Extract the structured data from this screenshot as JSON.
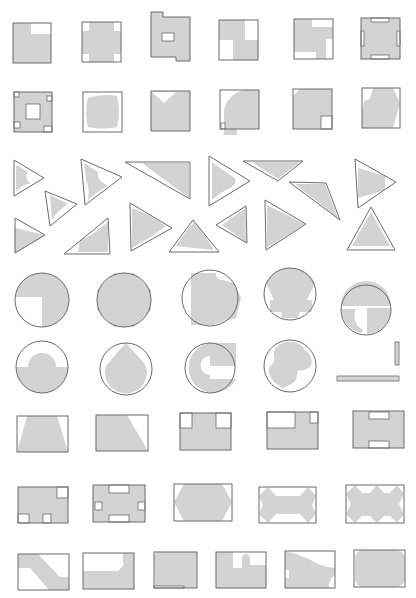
{
  "figure": {
    "title": "",
    "colors": {
      "fill": "#d3d3d3",
      "outline": "#6a6a6a",
      "background": "#ffffff"
    },
    "rows": [
      {
        "name": "squares-row-1",
        "count": 6
      },
      {
        "name": "squares-row-2",
        "count": 6
      },
      {
        "name": "triangles",
        "count": 15
      },
      {
        "name": "circles-row-1",
        "count": 5
      },
      {
        "name": "circles-row-2",
        "count": 5
      },
      {
        "name": "rectangles-row-1",
        "count": 5
      },
      {
        "name": "rectangles-row-2",
        "count": 5
      },
      {
        "name": "rectangles-row-3",
        "count": 6
      }
    ]
  },
  "shapes": [
    {
      "id": "sq1",
      "type": "rect-notched",
      "outline": [
        13,
        23,
        38,
        40
      ],
      "fill": "M13,23H31V34H51V63H13Z",
      "holes": []
    },
    {
      "id": "sq2",
      "type": "rect-corners",
      "outline": [
        82,
        22,
        39,
        40
      ],
      "fill": "M89,22H114V31H121V54H114V62H89V54H82V31H89Z",
      "holes": []
    },
    {
      "id": "sq3",
      "type": "rect-with-hole",
      "outline": null,
      "fill": "M151,12H163V17H190V61H176V57H151Z",
      "holes": [
        [
          162,
          33,
          12,
          8
        ]
      ]
    },
    {
      "id": "sq4",
      "type": "rect-pinwheel",
      "outline": [
        219,
        20,
        39,
        40
      ],
      "fill": "M219,20H245V40H258V60H233V40H219Z",
      "holes": []
    },
    {
      "id": "sq5",
      "type": "rect-pinwheel",
      "outline": [
        294,
        19,
        39,
        40
      ],
      "fill": "M302,19H312V27H333V39H326V59H316V52H294V19Z",
      "holes": []
    },
    {
      "id": "sq6",
      "type": "rect-slots",
      "outline": [
        361,
        18,
        39,
        41
      ],
      "fill": "M361,18H400V59H361Z",
      "holes": [
        [
          371,
          18,
          18,
          4
        ],
        [
          371,
          55,
          18,
          4
        ],
        [
          361,
          31,
          3,
          15
        ],
        [
          397,
          31,
          3,
          15
        ]
      ]
    },
    {
      "id": "sq7",
      "type": "rect-hollow",
      "outline": [
        14,
        92,
        38,
        40
      ],
      "fill": "M14,92H52V132H14Z",
      "holes": [
        [
          26,
          104,
          14,
          15
        ],
        [
          14,
          92,
          5,
          5
        ],
        [
          47,
          96,
          5,
          5
        ],
        [
          14,
          122,
          6,
          6
        ],
        [
          44,
          126,
          8,
          6
        ]
      ]
    },
    {
      "id": "sq8",
      "type": "rect-rounded-blob",
      "outline": [
        83,
        92,
        39,
        40
      ],
      "fill": "M88,98Q102,93 117,96Q121,112 117,127Q102,130 88,127Q84,112 88,98Z",
      "holes": []
    },
    {
      "id": "sq9",
      "type": "rect-v-notch",
      "outline": null,
      "fill": "M151,91H190V131H151Z",
      "holes": [],
      "cuts": "M152,92L176,92L164,103Z"
    },
    {
      "id": "sq10",
      "type": "rect-quarter-circle",
      "outline": [
        220,
        90,
        39,
        39
      ],
      "fill": "M244,90H259V129H237V135H224V110Q228,94 244,90Z",
      "holes": [
        [
          221,
          123,
          4,
          6
        ]
      ]
    },
    {
      "id": "sq11",
      "type": "rect-corner-cut",
      "outline": [
        293,
        89,
        39,
        40
      ],
      "fill": "M300,89H332V129H293V96Z",
      "holes": [
        [
          321,
          116,
          11,
          13
        ]
      ]
    },
    {
      "id": "sq12",
      "type": "rect-hexagon",
      "outline": [
        362,
        88,
        38,
        40
      ],
      "fill": "M373,88H393L400,103L393,128H362V110L368,88Z",
      "holes": [],
      "cuts": "M362,88L373,88L370,99L363,101Z"
    }
  ],
  "triangles": [
    {
      "id": "tri1",
      "points": "14,160 44,178 14,196",
      "blobs": "M16,165Q22,168 28,172Q24,178 30,184Q22,184 16,192Z"
    },
    {
      "id": "tri2",
      "points": "81,159 122,177 85,205",
      "blobs": "M84,163Q92,168 98,172Q96,180 108,186Q96,192 88,200Q90,188 86,180Z"
    },
    {
      "id": "tri3",
      "points": "125,162 190,162 190,199",
      "blobs": "M142,163L189,163L189,198Z"
    },
    {
      "id": "tri4",
      "points": "209,156 250,181 209,206",
      "blobs": "M212,162Q222,170 232,176Q240,182 230,188Q218,194 212,200Z"
    },
    {
      "id": "tri5",
      "points": "243,161 303,161 278,181",
      "blobs": "M252,162L300,162L278,179Z"
    },
    {
      "id": "tri6",
      "points": "355,159 396,182 358,208",
      "blobs": "M358,168L385,176L385,190L358,198Z"
    },
    {
      "id": "tri7",
      "points": "45,191 77,204 50,226",
      "blobs": "M50,195Q60,200 68,204Q58,210 52,220Z"
    },
    {
      "id": "tri8",
      "points": "289,182 326,183 340,220",
      "blobs": "M295,184L325,184L338,218Z"
    },
    {
      "id": "tri9",
      "points": "15,218 45,235 15,253",
      "blobs": "M15,228L45,235L15,253Z"
    },
    {
      "id": "tri10",
      "points": "64,254 108,218 110,254",
      "blobs": "M80,240Q92,236 100,228L108,222L108,252L78,252Z"
    },
    {
      "id": "tri11",
      "points": "130,203 172,228 131,251",
      "blobs": "M132,208Q150,214 166,226Q150,238 132,248Z"
    },
    {
      "id": "tri12",
      "points": "169,252 193,220 219,252",
      "blobs": "M176,246Q186,230 194,222Q206,236 214,250Z"
    },
    {
      "id": "tri13",
      "points": "216,225 246,206 247,243",
      "blobs": "M222,225L245,208L246,242Z"
    },
    {
      "id": "tri14",
      "points": "265,200 306,224 266,250",
      "blobs": "M267,205L305,224L267,248Z"
    },
    {
      "id": "tri15",
      "points": "347,250 371,207 395,250",
      "blobs": "M352,246L371,212L390,246Z"
    }
  ],
  "circles": [
    {
      "id": "c1",
      "cx": 42,
      "cy": 300,
      "r": 27,
      "fill": "M42,273A27,27 0 1 1 42,327L42,297L15,297A27,27 0 0 1 42,273Z"
    },
    {
      "id": "c2",
      "cx": 124,
      "cy": 300,
      "r": 27,
      "fill": "M114,273L134,273L151,290L151,310L134,327L114,327L97,310L97,290Z"
    },
    {
      "id": "c3",
      "cx": 210,
      "cy": 298,
      "r": 28,
      "fill": "M191,273H215L218,279L234,283L241,298L236,318L213,325L191,325Z"
    },
    {
      "id": "c4",
      "cx": 290,
      "cy": 294,
      "r": 26,
      "fill": "M290,268A26,26 0 0 1 315,283L307,300H312V312H300L298,318H282L281,312H270V300H274L266,283A26,26 0 0 1 290,268Z"
    },
    {
      "id": "c5",
      "cx": 366,
      "cy": 310,
      "r": 25,
      "fill": "M341,306A25,25 0 0 1 391,306Z M367,308H391A25,25 0 0 1 367,334Z M346,309H356A16,16 0 0 0 363,330L362,333A25,25 0 0 1 341,309Z"
    },
    {
      "id": "c6",
      "cx": 42,
      "cy": 367,
      "r": 26,
      "fill": "M28,367A14,14 0 0 1 56,367H68A26,26 0 0 1 16,367Z"
    },
    {
      "id": "c7",
      "cx": 126,
      "cy": 369,
      "r": 26,
      "fill": "M126,343Q138,356 146,366A21,21 0 1 1 106,366Q114,356 126,343Z"
    },
    {
      "id": "c8",
      "cx": 210,
      "cy": 368,
      "r": 25,
      "fill": "M210,343H236V366H210V379H236A25,25 0 1 1 210,343Z M210,356A8,8 0 0 0 210,375Z"
    },
    {
      "id": "c9",
      "cx": 290,
      "cy": 366,
      "r": 26,
      "fill": "M284,342Q300,340 305,350Q314,356 311,366Q304,372 298,370L296,380Q290,386 282,388L274,382Q266,372 270,366Q276,362 274,356Q272,348 284,342Z"
    }
  ],
  "bars": [
    {
      "id": "bar-vertical",
      "x": 395,
      "y": 342,
      "w": 4,
      "h": 23
    },
    {
      "id": "bar-horizontal",
      "x": 337,
      "y": 376,
      "w": 62,
      "h": 5
    }
  ],
  "rects": [
    {
      "id": "r1",
      "outline": [
        17,
        416,
        51,
        36
      ],
      "fill": "M27,416H57L68,452H17Z"
    },
    {
      "id": "r2",
      "outline": [
        96,
        415,
        52,
        36
      ],
      "fill": "M96,415H127L148,451H96Z"
    },
    {
      "id": "r3",
      "outline": [
        180,
        413,
        51,
        37
      ],
      "fill": "M180,413H231V450H180Z",
      "holes": [
        [
          180,
          413,
          12,
          15
        ],
        [
          216,
          413,
          15,
          15
        ]
      ]
    },
    {
      "id": "r4",
      "outline": [
        267,
        412,
        51,
        37
      ],
      "fill": "M267,412H318V449H267Z",
      "holes": [
        [
          267,
          412,
          28,
          16
        ],
        [
          310,
          412,
          8,
          11
        ]
      ]
    },
    {
      "id": "r5",
      "outline": [
        353,
        411,
        51,
        37
      ],
      "fill": "M353,411H404V448H353Z",
      "holes": [
        [
          369,
          412,
          20,
          7
        ],
        [
          369,
          441,
          20,
          7
        ]
      ]
    },
    {
      "id": "r6",
      "outline": [
        18,
        487,
        50,
        36
      ],
      "fill": "M18,487H68V523H18Z",
      "holes": [
        [
          57,
          487,
          11,
          11
        ],
        [
          18,
          514,
          11,
          9
        ],
        [
          43,
          514,
          8,
          9
        ]
      ]
    },
    {
      "id": "r7",
      "outline": [
        93,
        485,
        52,
        37
      ],
      "fill": "M93,485H145V522H93Z",
      "holes": [
        [
          109,
          485,
          20,
          8
        ],
        [
          95,
          502,
          7,
          8
        ],
        [
          138,
          502,
          7,
          8
        ],
        [
          109,
          515,
          20,
          7
        ]
      ]
    },
    {
      "id": "r8",
      "outline": [
        174,
        484,
        58,
        37
      ],
      "fill": "M184,484H222L232,502L222,521H184L174,502Z"
    },
    {
      "id": "r9",
      "outline": [
        259,
        487,
        57,
        36
      ],
      "fill": "M268,487L276,496H300L308,487L316,496L312,505L316,514L308,523L300,514H276L268,523L259,514L263,505L259,496Z"
    },
    {
      "id": "r10",
      "outline": [
        346,
        485,
        58,
        38
      ],
      "fill": "M355,485L362,493H370L377,485L384,493H390L397,485L404,494L399,504L404,514L397,523L390,516H384L377,523L370,516H362L355,523L346,514L351,504L346,494Z"
    },
    {
      "id": "r11",
      "outline": [
        18,
        554,
        51,
        36
      ],
      "fill": "M18,554H38L60,577H69V590H49L30,568H18Z"
    },
    {
      "id": "r12",
      "outline": [
        83,
        553,
        51,
        36
      ],
      "fill": "M123,553H134V589H117L134,581V589H83V571H118L123,566Z"
    },
    {
      "id": "r13",
      "outline": [
        154,
        552,
        43,
        36
      ],
      "fill": "M157,552H197V588H155L154,556Z",
      "holes": [
        [
          154,
          586,
          30,
          2
        ]
      ]
    },
    {
      "id": "r14",
      "outline": [
        216,
        552,
        50,
        36
      ],
      "fill": "M216,552H233V568H242V558A4,4 0 0 1 250,558V565H266V588H216Z"
    },
    {
      "id": "r15",
      "outline": [
        285,
        551,
        50,
        37
      ],
      "fill": "M285,551Q305,556 318,564Q330,568 335,568V575Q328,580 329,588H285V578H289V570H285Z"
    },
    {
      "id": "r16",
      "outline": [
        354,
        550,
        51,
        37
      ],
      "fill": "M362,550H398Q405,552 405,560V580Q403,587 395,587H362Q355,585 355,578V558Q356,551 362,550Z"
    }
  ]
}
